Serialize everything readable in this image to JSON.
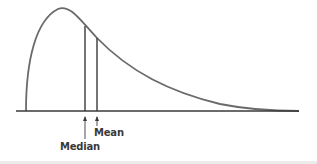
{
  "diagram": {
    "type": "positively-skewed-density-curve",
    "colors": {
      "curve": "#6a6a6a",
      "axis": "#3a3a3a",
      "markers": "#3a3a3a",
      "text": "#3a3a3a"
    },
    "markers": [
      {
        "id": "median",
        "label": "Median",
        "x": 85,
        "top": 26
      },
      {
        "id": "mean",
        "label": "Mean",
        "x": 97,
        "top": 38
      }
    ]
  }
}
